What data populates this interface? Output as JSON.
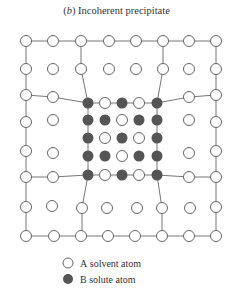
{
  "figure": {
    "label": "(b)",
    "title": "Incoherent precipitate"
  },
  "legend": {
    "items": [
      {
        "symbol": "open-circle",
        "letter": "A",
        "text": "solvent atom",
        "color": "#ffffff"
      },
      {
        "symbol": "filled-circle",
        "letter": "B",
        "text": "solute atom",
        "color": "#555555"
      }
    ]
  },
  "colors": {
    "line": "#777777",
    "solvent_fill": "#ffffff",
    "solvent_stroke": "#666666",
    "solute_fill": "#555555"
  },
  "lattice": {
    "outer_grid": "8x8 solvent matrix",
    "precipitate_grid": "5x5",
    "precipitate_pattern": [
      [
        "B",
        "A",
        "B",
        "A",
        "B"
      ],
      [
        "B",
        "B",
        "A",
        "B",
        "B"
      ],
      [
        "B",
        "A",
        "B",
        "A",
        "B"
      ],
      [
        "B",
        "B",
        "A",
        "B",
        "B"
      ],
      [
        "B",
        "A",
        "B",
        "A",
        "B"
      ]
    ]
  }
}
